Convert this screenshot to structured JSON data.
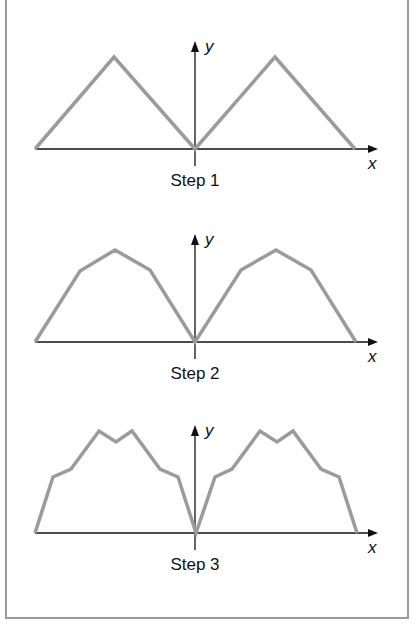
{
  "figure": {
    "panels": [
      {
        "caption": "Step 1",
        "x_axis_label": "x",
        "y_axis_label": "y",
        "origin": [
          195,
          149
        ],
        "curve": [
          [
            35,
            149
          ],
          [
            114,
            57
          ],
          [
            195,
            149
          ],
          [
            275,
            57
          ],
          [
            355,
            149
          ]
        ]
      },
      {
        "caption": "Step 2",
        "x_axis_label": "x",
        "y_axis_label": "y",
        "origin": [
          195,
          342
        ],
        "curve": [
          [
            35,
            342
          ],
          [
            80,
            271
          ],
          [
            115,
            250
          ],
          [
            150,
            270
          ],
          [
            195,
            342
          ],
          [
            241,
            270
          ],
          [
            276,
            250
          ],
          [
            311,
            270
          ],
          [
            356,
            342
          ]
        ]
      },
      {
        "caption": "Step 3",
        "x_axis_label": "x",
        "y_axis_label": "y",
        "origin": [
          195,
          533
        ],
        "curve": [
          [
            35,
            533
          ],
          [
            53,
            477
          ],
          [
            71,
            469
          ],
          [
            99,
            431
          ],
          [
            116,
            442
          ],
          [
            132,
            431
          ],
          [
            160,
            469
          ],
          [
            178,
            477
          ],
          [
            196,
            533
          ],
          [
            215,
            477
          ],
          [
            232,
            469
          ],
          [
            260,
            431
          ],
          [
            277,
            442
          ],
          [
            293,
            431
          ],
          [
            321,
            469
          ],
          [
            339,
            477
          ],
          [
            357,
            533
          ]
        ]
      }
    ],
    "colors": {
      "curve": "#9b9b9b",
      "axis": "#111111",
      "frame": "#9a9a9a"
    }
  }
}
